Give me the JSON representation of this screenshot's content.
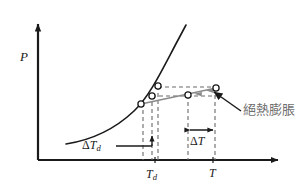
{
  "figure": {
    "type": "line-diagram",
    "axes": {
      "y_label": "P",
      "x_label": "",
      "x_ticks": [
        {
          "label_main": "T",
          "label_sub": "d",
          "x": 155
        },
        {
          "label_main": "T",
          "label_sub": "",
          "x": 213
        }
      ]
    },
    "annotations": {
      "delta_td": {
        "delta": "Δ",
        "main": "T",
        "sub": "d"
      },
      "delta_t": {
        "delta": "Δ",
        "main": "T",
        "sub": ""
      },
      "adiabatic": "絕熱膨脹"
    },
    "colors": {
      "axis": "#1a1a1a",
      "curve": "#1a1a1a",
      "adiabat": "#7d7d7d",
      "dashed": "#6a6a6a",
      "label_cjk": "#6e6e6e",
      "background": "#ffffff"
    }
  }
}
